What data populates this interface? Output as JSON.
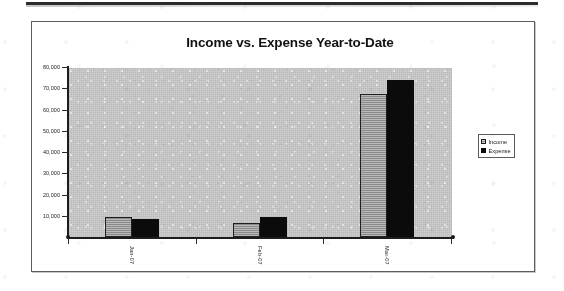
{
  "document": {
    "top_rule": "horizontal-rule"
  },
  "chart": {
    "title": "Income vs. Expense Year-to-Date",
    "legend": {
      "position": "right",
      "entries": [
        {
          "label": "Income",
          "swatch": "income-swatch",
          "color": "#9c9c9c"
        },
        {
          "label": "Expense",
          "swatch": "expense-swatch",
          "color": "#0b0b0b"
        }
      ]
    },
    "plot_background": "#cfcfcf",
    "axis_color": "#1d1d1d"
  },
  "chart_data": {
    "type": "bar",
    "title": "Income vs. Expense Year-to-Date",
    "xlabel": "",
    "ylabel": "",
    "categories": [
      "Jan-07",
      "Feb-07",
      "Mar-07"
    ],
    "series": [
      {
        "name": "Income",
        "values": [
          9300,
          6700,
          67500
        ],
        "color": "#9c9c9c"
      },
      {
        "name": "Expense",
        "values": [
          8400,
          9500,
          74000
        ],
        "color": "#0b0b0b"
      }
    ],
    "ylim": [
      0,
      80000
    ],
    "ytick_values": [
      10000,
      20000,
      30000,
      40000,
      50000,
      60000,
      70000,
      80000
    ],
    "ytick_labels": [
      "10,000",
      "20,000",
      "30,000",
      "40,000",
      "50,000",
      "60,000",
      "70,000",
      "80,000"
    ],
    "xtick_labels": [
      "Jan-07",
      "Feb-07",
      "Mar-07"
    ],
    "xtick_rotation": 90,
    "grid": false,
    "legend_position": "right"
  }
}
